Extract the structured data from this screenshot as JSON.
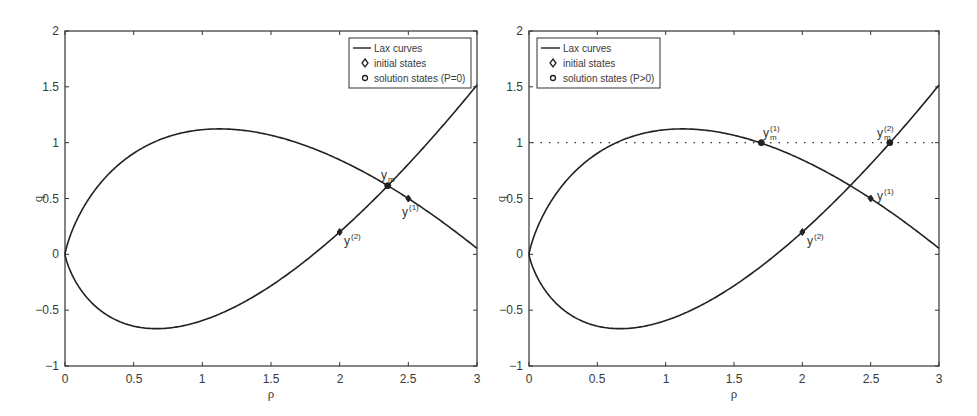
{
  "chart_data": [
    {
      "type": "line",
      "panel": "left",
      "title": "",
      "xlabel": "ρ",
      "ylabel": "q",
      "xlim": [
        0,
        3
      ],
      "ylim": [
        -1,
        2
      ],
      "xticks": [
        "0",
        "0.5",
        "1",
        "1.5",
        "2",
        "2.5",
        "3"
      ],
      "yticks": [
        "-1",
        "-0.5",
        "0",
        "0.5",
        "1",
        "1.5",
        "2"
      ],
      "grid": false,
      "legend_position": "upper right",
      "legend": [
        "Lax curves",
        "initial states",
        "solution states (P=0)"
      ],
      "series": [
        {
          "name": "Lax curve through y(1)",
          "formula": "q = ρ(0.2 − ln(ρ/2.5))",
          "x": [
            0,
            0.1,
            0.25,
            0.5,
            0.75,
            1.0,
            1.12,
            1.25,
            1.5,
            1.75,
            2.0,
            2.25,
            2.5,
            2.75,
            3.0
          ],
          "y": [
            0,
            0.34,
            0.63,
            0.9,
            1.05,
            1.12,
            1.12,
            1.12,
            1.07,
            0.97,
            0.85,
            0.69,
            0.5,
            0.29,
            0.05
          ]
        },
        {
          "name": "Lax curve through y(2)",
          "formula": "q = ρ(0.1 + ln(ρ/2))",
          "x": [
            0,
            0.1,
            0.25,
            0.5,
            0.67,
            0.75,
            1.0,
            1.25,
            1.5,
            1.75,
            2.0,
            2.25,
            2.5,
            2.75,
            3.0
          ],
          "y": [
            0,
            -0.29,
            -0.5,
            -0.64,
            -0.67,
            -0.66,
            -0.59,
            -0.46,
            -0.28,
            -0.06,
            0.2,
            0.49,
            0.81,
            1.15,
            1.52
          ]
        }
      ],
      "points": [
        {
          "label": "y(1)",
          "kind": "initial",
          "x": 2.5,
          "y": 0.5
        },
        {
          "label": "y(2)",
          "kind": "initial",
          "x": 2.0,
          "y": 0.2
        },
        {
          "label": "y_m",
          "kind": "solution",
          "x": 2.35,
          "y": 0.615
        }
      ]
    },
    {
      "type": "line",
      "panel": "right",
      "title": "",
      "xlabel": "ρ",
      "ylabel": "q",
      "xlim": [
        0,
        3
      ],
      "ylim": [
        -1,
        2
      ],
      "xticks": [
        "0",
        "0.5",
        "1",
        "1.5",
        "2",
        "2.5",
        "3"
      ],
      "yticks": [
        "-1",
        "-0.5",
        "0",
        "0.5",
        "1",
        "1.5",
        "2"
      ],
      "grid": false,
      "legend_position": "upper left",
      "legend": [
        "Lax curves",
        "initial states",
        "solution states (P>0)"
      ],
      "series": [
        {
          "name": "Lax curve through y(1)",
          "formula": "q = ρ(0.2 − ln(ρ/2.5))",
          "x": [
            0,
            0.1,
            0.25,
            0.5,
            0.75,
            1.0,
            1.12,
            1.25,
            1.5,
            1.75,
            2.0,
            2.25,
            2.5,
            2.75,
            3.0
          ],
          "y": [
            0,
            0.34,
            0.63,
            0.9,
            1.05,
            1.12,
            1.12,
            1.12,
            1.07,
            0.97,
            0.85,
            0.69,
            0.5,
            0.29,
            0.05
          ]
        },
        {
          "name": "Lax curve through y(2)",
          "formula": "q = ρ(0.1 + ln(ρ/2))",
          "x": [
            0,
            0.1,
            0.25,
            0.5,
            0.67,
            0.75,
            1.0,
            1.25,
            1.5,
            1.75,
            2.0,
            2.25,
            2.5,
            2.75,
            3.0
          ],
          "y": [
            0,
            -0.29,
            -0.5,
            -0.64,
            -0.67,
            -0.66,
            -0.59,
            -0.46,
            -0.28,
            -0.06,
            0.2,
            0.49,
            0.81,
            1.15,
            1.52
          ]
        },
        {
          "name": "q = 1 (dotted)",
          "style": "dotted",
          "x": [
            0,
            3
          ],
          "y": [
            1,
            1
          ]
        }
      ],
      "points": [
        {
          "label": "y(1)",
          "kind": "initial",
          "x": 2.5,
          "y": 0.5
        },
        {
          "label": "y(2)",
          "kind": "initial",
          "x": 2.0,
          "y": 0.2
        },
        {
          "label": "y_m(1)",
          "kind": "solution",
          "x": 1.7,
          "y": 1.0
        },
        {
          "label": "y_m(2)",
          "kind": "solution",
          "x": 2.64,
          "y": 1.0
        }
      ]
    }
  ],
  "panels": {
    "left": {
      "xlabel": "ρ",
      "ylabel": "q",
      "legend": {
        "line": "Lax curves",
        "initial": "initial states",
        "solution": "solution states (P=0)"
      },
      "annotations": {
        "ym": "y",
        "ym_sub": "m",
        "y1": "y",
        "y1_sup": "(1)",
        "y2": "y",
        "y2_sup": "(2)"
      }
    },
    "right": {
      "xlabel": "ρ",
      "ylabel": "q",
      "legend": {
        "line": "Lax curves",
        "initial": "initial states",
        "solution": "solution states (P>0)"
      },
      "annotations": {
        "ym1": "y",
        "ym1_sub": "m",
        "ym1_sup": "(1)",
        "ym2": "y",
        "ym2_sub": "m",
        "ym2_sup": "(2)",
        "y1": "y",
        "y1_sup": "(1)",
        "y2": "y",
        "y2_sup": "(2)"
      }
    },
    "ticks": {
      "x": [
        "0",
        "0.5",
        "1",
        "1.5",
        "2",
        "2.5",
        "3"
      ],
      "y": [
        "2",
        "1.5",
        "1",
        "0.5",
        "0",
        "−0.5",
        "−1"
      ]
    }
  }
}
